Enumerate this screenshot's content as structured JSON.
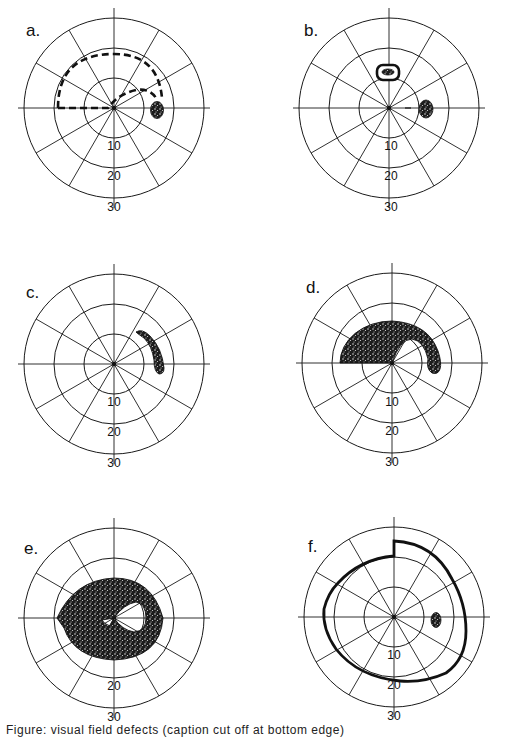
{
  "figure": {
    "type": "polar visual field diagrams",
    "panels": [
      {
        "id": "a",
        "label": "a.",
        "ring_labels": [
          "10",
          "20",
          "30"
        ],
        "description": "Dashed path from left horizontal meridian arching over fixation to a stippled spot right of center (blind spot)"
      },
      {
        "id": "b",
        "label": "b.",
        "ring_labels": [
          "10",
          "20",
          "30"
        ],
        "description": "Ring-shaped scotoma above fixation and stippled blind spot right of center"
      },
      {
        "id": "c",
        "label": "c.",
        "ring_labels": [
          "10",
          "20",
          "30"
        ],
        "description": "Stippled arcuate (crescent) defect extending from blind spot upward"
      },
      {
        "id": "d",
        "label": "d.",
        "ring_labels": [
          "10",
          "20",
          "30"
        ],
        "description": "Stippled superior arcuate scotoma connected to blind spot"
      },
      {
        "id": "e",
        "label": "e.",
        "ring_labels": [
          "20",
          "30"
        ],
        "description": "Stippled annular (ring) scotoma surrounding fixation"
      },
      {
        "id": "f",
        "label": "f.",
        "ring_labels": [
          "10",
          "20",
          "30"
        ],
        "description": "Thick boundary of constricted field with nasal step; stippled blind spot"
      }
    ],
    "ring_values_deg": [
      10,
      20,
      30
    ],
    "spokes": 12
  },
  "caption": {
    "text": "Figure: visual field defects (caption cut off at bottom edge)"
  }
}
